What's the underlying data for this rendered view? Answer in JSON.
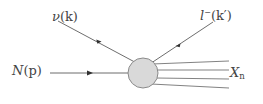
{
  "diagram": {
    "type": "feynman-diagram",
    "background_color": "#ffffff",
    "line_color": "#555555",
    "blob_fill_color": "#d9d9d9",
    "blob_stroke_color": "#8a8a8a",
    "text_color": "#444444",
    "labels": {
      "incoming_neutrino": {
        "particle": "ν",
        "momentum": "(k)"
      },
      "outgoing_lepton": {
        "particle": "l",
        "charge": "−",
        "momentum": "(k′)"
      },
      "incoming_nucleon": {
        "particle": "N",
        "momentum": "(p)"
      },
      "hadronic_final_state": {
        "particle": "X",
        "subscript": "n"
      }
    },
    "vertex": {
      "shape": "circle",
      "cx": 143,
      "cy": 73,
      "r": 15
    },
    "lines": [
      {
        "name": "incoming-neutrino-line",
        "x1": 58,
        "y1": 21,
        "x2": 136,
        "y2": 63,
        "arrow_at": 0.58,
        "arrow_dir": "down-right"
      },
      {
        "name": "outgoing-lepton-line",
        "x1": 151,
        "y1": 63,
        "x2": 213,
        "y2": 22,
        "arrow_at": 0.45,
        "arrow_dir": "up-right"
      },
      {
        "name": "incoming-nucleon-line",
        "x1": 50,
        "y1": 73,
        "x2": 128,
        "y2": 73,
        "arrow_at": 0.6,
        "arrow_dir": "right"
      },
      {
        "name": "hadron-line-1",
        "x1": 153,
        "y1": 64,
        "x2": 228,
        "y2": 62
      },
      {
        "name": "hadron-line-2",
        "x1": 156,
        "y1": 70,
        "x2": 228,
        "y2": 70
      },
      {
        "name": "hadron-line-3",
        "x1": 156,
        "y1": 78,
        "x2": 228,
        "y2": 79
      },
      {
        "name": "hadron-line-4",
        "x1": 152,
        "y1": 84,
        "x2": 228,
        "y2": 88
      }
    ]
  }
}
